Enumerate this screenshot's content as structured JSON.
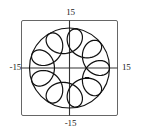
{
  "figure": {
    "title": "",
    "background_color": "#ffffff",
    "frame_color": "#555555",
    "axis_color": "#333333",
    "curve_color": "#111111"
  },
  "axis_labels": {
    "top": "15",
    "bottom": "-15",
    "left": "-15",
    "right": "15"
  },
  "chart_data": {
    "type": "line",
    "title": "",
    "xlabel": "",
    "ylabel": "",
    "xlim": [
      -15,
      15
    ],
    "ylim": [
      -15,
      15
    ],
    "xticks": [
      -15,
      15
    ],
    "yticks": [
      -15,
      15
    ],
    "xtick_labels": [
      "-15",
      "15"
    ],
    "ytick_labels": [
      "-15",
      "15"
    ],
    "grid": false,
    "legend": null,
    "axes_style": "centered-cross-with-box-frame",
    "series": [
      {
        "name": "hypotrochoid",
        "description": "Parametric looping curve (hypotrochoid / epitrochoid style) with 9 inner loops, enclosed by an outer circular envelope of radius approximately 12.5",
        "parametric": {
          "parameter": "t",
          "t_range": [
            0,
            6.283185307179586
          ],
          "t_cycles": 9,
          "x_expression": "R*cos(t) + d*cos(k*t)",
          "y_expression": "R*sin(t) - d*sin(k*t)",
          "R": 8.6,
          "d": 3.9,
          "k": 8,
          "outer_radius": 12.5,
          "loop_count": 9
        }
      },
      {
        "name": "outer-envelope-circle",
        "description": "Circle bounding the looping curve",
        "center": [
          0,
          0
        ],
        "radius": 12.5
      }
    ]
  }
}
